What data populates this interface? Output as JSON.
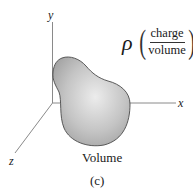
{
  "figure": {
    "label": "(c)",
    "axes": {
      "x_label": "x",
      "y_label": "y",
      "z_label": "z"
    },
    "density": {
      "symbol": "ρ",
      "numerator": "charge",
      "denominator": "volume"
    },
    "region_label": "Volume",
    "colors": {
      "axis": "#8a8a8a",
      "blob_fill_light": "#e6e6e6",
      "blob_fill_dark": "#a8a8a8",
      "blob_outline": "#4a4a4a",
      "text": "#1a1a1a"
    }
  }
}
